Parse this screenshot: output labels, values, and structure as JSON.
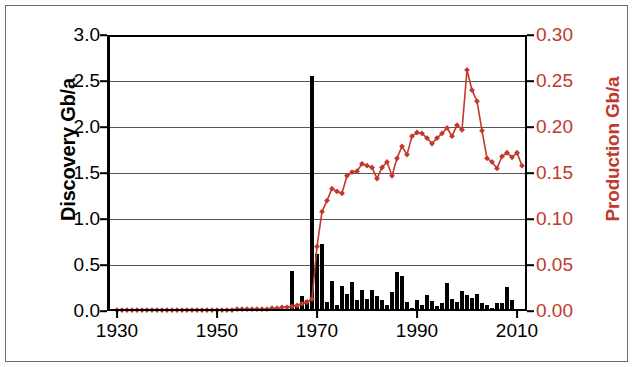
{
  "chart_data": {
    "type": "bar",
    "title": "",
    "subtitle": "",
    "xlabel": "",
    "ylabel": "Discovery Gb/a",
    "y2label": "Production Gb/a",
    "xlim": [
      1928,
      2012
    ],
    "ylim": [
      0.0,
      3.0
    ],
    "y2lim": [
      0.0,
      0.3
    ],
    "grid": true,
    "legend": "none",
    "xticks": [
      "1930",
      "1950",
      "1970",
      "1990",
      "2010"
    ],
    "xtick_values": [
      1930,
      1950,
      1970,
      1990,
      2010
    ],
    "yticks_left": [
      "0.0",
      "0.5",
      "1.0",
      "1.5",
      "2.0",
      "2.5",
      "3.0"
    ],
    "ytick_left_values": [
      0.0,
      0.5,
      1.0,
      1.5,
      2.0,
      2.5,
      3.0
    ],
    "yticks_right": [
      "0.00",
      "0.05",
      "0.10",
      "0.15",
      "0.20",
      "0.25",
      "0.30"
    ],
    "ytick_right_values": [
      0.0,
      0.05,
      0.1,
      0.15,
      0.2,
      0.25,
      0.3
    ],
    "colors": {
      "discovery_bars": "#000000",
      "production_line": "#c0392b",
      "grid": "#555555",
      "axis": "#000000",
      "frame": "#6d6d6d",
      "background": "#ffffff"
    },
    "series": [
      {
        "name": "Discovery Gb/a",
        "type": "bar",
        "axis": "left",
        "color": "#000000",
        "x": [
          1930,
          1931,
          1932,
          1933,
          1934,
          1935,
          1936,
          1937,
          1938,
          1939,
          1940,
          1941,
          1942,
          1943,
          1944,
          1945,
          1946,
          1947,
          1948,
          1949,
          1950,
          1951,
          1952,
          1953,
          1954,
          1955,
          1956,
          1957,
          1958,
          1959,
          1960,
          1961,
          1962,
          1963,
          1964,
          1965,
          1966,
          1967,
          1968,
          1969,
          1970,
          1971,
          1972,
          1973,
          1974,
          1975,
          1976,
          1977,
          1978,
          1979,
          1980,
          1981,
          1982,
          1983,
          1984,
          1985,
          1986,
          1987,
          1988,
          1989,
          1990,
          1991,
          1992,
          1993,
          1994,
          1995,
          1996,
          1997,
          1998,
          1999,
          2000,
          2001,
          2002,
          2003,
          2004,
          2005,
          2006,
          2007,
          2008,
          2009,
          2010,
          2011
        ],
        "values": [
          0,
          0,
          0,
          0,
          0,
          0,
          0,
          0,
          0,
          0,
          0,
          0,
          0,
          0,
          0,
          0,
          0,
          0,
          0,
          0,
          0,
          0,
          0,
          0,
          0,
          0,
          0,
          0,
          0,
          0,
          0,
          0,
          0,
          0,
          0,
          0.43,
          0.04,
          0.16,
          0.12,
          2.55,
          0.62,
          0.73,
          0.1,
          0.33,
          0.07,
          0.27,
          0.18,
          0.32,
          0.12,
          0.23,
          0.13,
          0.23,
          0.16,
          0.12,
          0.06,
          0.21,
          0.42,
          0.38,
          0.1,
          0.03,
          0.12,
          0.06,
          0.17,
          0.11,
          0.05,
          0.09,
          0.3,
          0.13,
          0.1,
          0.22,
          0.17,
          0.14,
          0.19,
          0.09,
          0.07,
          0.03,
          0.09,
          0.09,
          0.26,
          0.12,
          0.02,
          0
        ]
      },
      {
        "name": "Production Gb/a",
        "type": "line",
        "axis": "right",
        "color": "#c0392b",
        "marker": "diamond",
        "x": [
          1930,
          1931,
          1932,
          1933,
          1934,
          1935,
          1936,
          1937,
          1938,
          1939,
          1940,
          1941,
          1942,
          1943,
          1944,
          1945,
          1946,
          1947,
          1948,
          1949,
          1950,
          1951,
          1952,
          1953,
          1954,
          1955,
          1956,
          1957,
          1958,
          1959,
          1960,
          1961,
          1962,
          1963,
          1964,
          1965,
          1966,
          1967,
          1968,
          1969,
          1970,
          1971,
          1972,
          1973,
          1974,
          1975,
          1976,
          1977,
          1978,
          1979,
          1980,
          1981,
          1982,
          1983,
          1984,
          1985,
          1986,
          1987,
          1988,
          1989,
          1990,
          1991,
          1992,
          1993,
          1994,
          1995,
          1996,
          1997,
          1998,
          1999,
          2000,
          2001,
          2002,
          2003,
          2004,
          2005,
          2006,
          2007,
          2008,
          2009,
          2010,
          2011
        ],
        "values": [
          0.001,
          0.001,
          0.001,
          0.001,
          0.001,
          0.001,
          0.001,
          0.001,
          0.001,
          0.001,
          0.001,
          0.001,
          0.001,
          0.001,
          0.001,
          0.001,
          0.001,
          0.001,
          0.001,
          0.001,
          0.001,
          0.001,
          0.001,
          0.001,
          0.002,
          0.002,
          0.002,
          0.002,
          0.002,
          0.002,
          0.002,
          0.003,
          0.003,
          0.004,
          0.004,
          0.005,
          0.006,
          0.008,
          0.01,
          0.013,
          0.07,
          0.108,
          0.12,
          0.133,
          0.13,
          0.128,
          0.147,
          0.151,
          0.152,
          0.16,
          0.158,
          0.156,
          0.144,
          0.156,
          0.162,
          0.147,
          0.166,
          0.179,
          0.17,
          0.19,
          0.194,
          0.193,
          0.188,
          0.182,
          0.188,
          0.193,
          0.199,
          0.19,
          0.202,
          0.197,
          0.262,
          0.24,
          0.228,
          0.196,
          0.166,
          0.162,
          0.155,
          0.168,
          0.172,
          0.167,
          0.172,
          0.158
        ]
      }
    ]
  },
  "axes": {
    "left_title": "Discovery Gb/a",
    "right_title": "Production Gb/a"
  }
}
